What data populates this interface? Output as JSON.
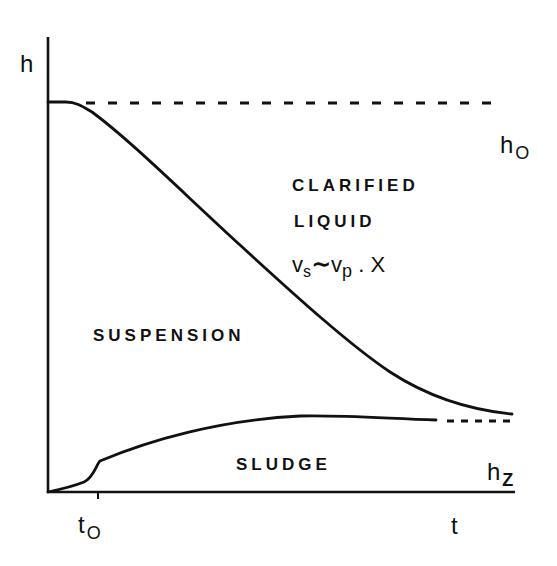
{
  "diagram": {
    "type": "batch-settling-curve",
    "axes": {
      "y_label": "h",
      "x_label": "t"
    },
    "markers": {
      "h0": {
        "base": "h",
        "sub": "O"
      },
      "hz": {
        "base": "h",
        "sub": "Z"
      },
      "t0": {
        "base": "t",
        "sub": "O"
      }
    },
    "regions": {
      "clarified_line1": "CLARIFIED",
      "clarified_line2": "LIQUID",
      "suspension": "SUSPENSION",
      "sludge": "SLUDGE"
    },
    "equation": {
      "v1": "v",
      "s1": "s",
      "rel": "∼",
      "v2": "v",
      "s2": "p",
      "tail": " . X"
    },
    "colors": {
      "ink": "#111111",
      "background": "#ffffff"
    }
  }
}
